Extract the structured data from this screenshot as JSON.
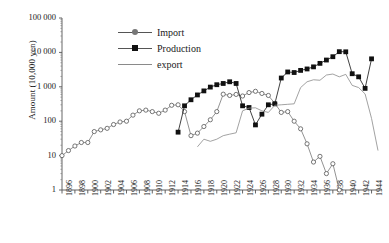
{
  "chart_data": {
    "type": "line",
    "title": "",
    "xlabel": "",
    "ylabel": "Amount (10,000 yen)",
    "yscale": "log",
    "ylim": [
      1,
      100000
    ],
    "ytick_labels": [
      "100 000",
      "10 000",
      "1 000",
      "100",
      "10",
      "1"
    ],
    "ytick_values": [
      100000,
      10000,
      1000,
      100,
      10,
      1
    ],
    "xlim": [
      1896,
      1945
    ],
    "xtick_labels": [
      "1896",
      "1898",
      "1900",
      "1902",
      "1904",
      "1906",
      "1908",
      "1910",
      "1912",
      "1914",
      "1916",
      "1918",
      "1920",
      "1922",
      "1924",
      "1926",
      "1928",
      "1930",
      "1932",
      "1934",
      "1936",
      "1938",
      "1940",
      "1942",
      "1944"
    ],
    "grid": false,
    "legend_position": "upper-left-inside",
    "series": [
      {
        "name": "Import",
        "marker": "open-circle",
        "color": "#777777",
        "x": [
          1896,
          1897,
          1898,
          1899,
          1900,
          1901,
          1902,
          1903,
          1904,
          1905,
          1906,
          1907,
          1908,
          1909,
          1910,
          1911,
          1912,
          1913,
          1914,
          1915,
          1916,
          1917,
          1918,
          1919,
          1920,
          1921,
          1922,
          1923,
          1924,
          1925,
          1926,
          1927,
          1928,
          1929,
          1930,
          1931,
          1932,
          1933,
          1934,
          1935,
          1936,
          1937,
          1938,
          1939
        ],
        "values": [
          10,
          14,
          19,
          24,
          24,
          50,
          56,
          62,
          80,
          95,
          100,
          150,
          200,
          210,
          190,
          170,
          210,
          290,
          300,
          190,
          38,
          45,
          70,
          110,
          190,
          610,
          560,
          600,
          540,
          680,
          740,
          640,
          560,
          330,
          180,
          190,
          100,
          60,
          22,
          6.5,
          9.5,
          3,
          5.8,
          1
        ]
      },
      {
        "name": "Production",
        "marker": "filled-square",
        "color": "#111111",
        "x": [
          1914,
          1915,
          1916,
          1917,
          1918,
          1919,
          1920,
          1921,
          1922,
          1923,
          1924,
          1925,
          1926,
          1927,
          1928,
          1929,
          1930,
          1931,
          1932,
          1933,
          1934,
          1935,
          1936,
          1937,
          1938,
          1939,
          1940,
          1941,
          1942,
          1943,
          1944
        ],
        "values": [
          48,
          280,
          420,
          580,
          760,
          980,
          1150,
          1250,
          1400,
          1250,
          280,
          250,
          78,
          160,
          300,
          320,
          1800,
          2700,
          2600,
          3000,
          3300,
          3800,
          4800,
          6000,
          7500,
          10500,
          10400,
          2400,
          1950,
          900,
          6500
        ]
      },
      {
        "name": "export",
        "marker": "none",
        "color": "#8a8a8a",
        "x": [
          1917,
          1918,
          1919,
          1920,
          1921,
          1922,
          1923,
          1924,
          1925,
          1926,
          1927,
          1928,
          1929,
          1930,
          1931,
          1932,
          1933,
          1934,
          1935,
          1936,
          1937,
          1938,
          1939,
          1940,
          1941,
          1942,
          1943,
          1944,
          1945
        ],
        "values": [
          18,
          30,
          26,
          30,
          38,
          42,
          46,
          200,
          240,
          245,
          200,
          180,
          290,
          300,
          310,
          320,
          950,
          1400,
          1600,
          1550,
          2200,
          2350,
          1950,
          2300,
          1100,
          950,
          620,
          120,
          14
        ]
      }
    ]
  },
  "legend": {
    "items": [
      {
        "label": "Import",
        "symbol": "open-circle-line"
      },
      {
        "label": "Production",
        "symbol": "filled-square-line"
      },
      {
        "label": "export",
        "symbol": "plain-line"
      }
    ]
  }
}
